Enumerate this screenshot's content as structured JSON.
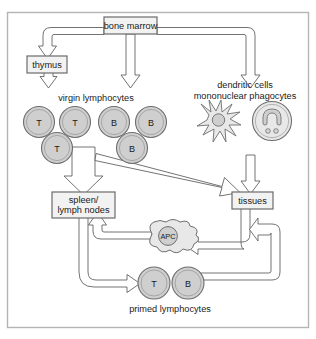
{
  "figure": {
    "name": "lymphocyte-circulation-diagram",
    "frame": {
      "border_color": "#b4b4b4",
      "background_color": "#ffffff"
    }
  },
  "style": {
    "line_color": "#4d4d4d",
    "box_fill": "#f2f2f2",
    "box_stroke": "#6b6b6b",
    "cell_fill": "#cfcfcf",
    "cell_stroke": "#6e6e6e",
    "cell_inner_stroke": "#8f8f8f",
    "arrow_fill": "#ffffff",
    "arrow_stroke": "#5a5a5a",
    "text_color": "#1a1a1a"
  },
  "boxes": [
    {
      "id": "bone-marrow",
      "label": "bone marrow"
    },
    {
      "id": "thymus",
      "label": "thymus"
    },
    {
      "id": "spleen-lymph-nodes",
      "label_line1": "spleen/",
      "label_line2": "lymph nodes"
    },
    {
      "id": "tissues",
      "label": "tissues"
    }
  ],
  "labels": [
    {
      "id": "virgin-lymphocytes",
      "text": "virgin lymphocytes"
    },
    {
      "id": "dendritic-cells",
      "text": "dendritic cells"
    },
    {
      "id": "mononuclear-phagocytes",
      "text": "mononuclear phagocytes"
    },
    {
      "id": "primed-lymphocytes",
      "text": "primed lymphocytes"
    }
  ],
  "virgin_lymphocytes": {
    "group_label": "virgin lymphocytes",
    "row1": [
      {
        "id": "virgin-t-cell-1",
        "letter": "T",
        "type": "T"
      },
      {
        "id": "virgin-t-cell-2",
        "letter": "T",
        "type": "T"
      },
      {
        "id": "virgin-b-cell-1",
        "letter": "B",
        "type": "B"
      },
      {
        "id": "virgin-b-cell-2",
        "letter": "B",
        "type": "B"
      }
    ],
    "row2": [
      {
        "id": "virgin-t-cell-3",
        "letter": "T",
        "type": "T"
      },
      {
        "id": "virgin-b-cell-3",
        "letter": "B",
        "type": "B"
      }
    ]
  },
  "primed_lymphocytes": {
    "group_label": "primed lymphocytes",
    "cells": [
      {
        "id": "primed-t-cell",
        "letter": "T",
        "type": "T"
      },
      {
        "id": "primed-b-cell",
        "letter": "B",
        "type": "B"
      }
    ]
  },
  "antigen_presenting_cell": {
    "id": "apc-cell",
    "label": "APC"
  },
  "accessory_cells": {
    "dendritic_cell": {
      "id": "dendritic-cell",
      "label": "dendritic cells"
    },
    "macrophage": {
      "id": "macrophage-cell",
      "label": "mononuclear phagocytes"
    }
  },
  "flows": [
    {
      "id": "bone-marrow-to-thymus",
      "from": "bone marrow",
      "to": "thymus"
    },
    {
      "id": "thymus-to-virgin-lymphocytes",
      "from": "thymus",
      "to": "virgin lymphocytes"
    },
    {
      "id": "bone-marrow-to-virgin-lymphocytes",
      "from": "bone marrow",
      "to": "virgin lymphocytes"
    },
    {
      "id": "bone-marrow-to-accessory-cells",
      "from": "bone marrow",
      "to": "dendritic cells / mononuclear phagocytes"
    },
    {
      "id": "virgin-lymphocytes-to-spleen",
      "from": "virgin lymphocytes",
      "to": "spleen/lymph nodes"
    },
    {
      "id": "virgin-lymphocytes-to-tissues",
      "from": "virgin lymphocytes",
      "to": "tissues"
    },
    {
      "id": "accessory-cells-to-tissues",
      "from": "dendritic cells / mononuclear phagocytes",
      "to": "tissues"
    },
    {
      "id": "tissues-to-apc",
      "from": "tissues",
      "to": "APC"
    },
    {
      "id": "apc-to-spleen",
      "from": "APC",
      "to": "spleen/lymph nodes"
    },
    {
      "id": "spleen-to-primed-lymphocytes",
      "from": "spleen/lymph nodes",
      "to": "primed lymphocytes"
    },
    {
      "id": "primed-lymphocytes-to-tissues",
      "from": "primed lymphocytes",
      "to": "tissues"
    }
  ]
}
